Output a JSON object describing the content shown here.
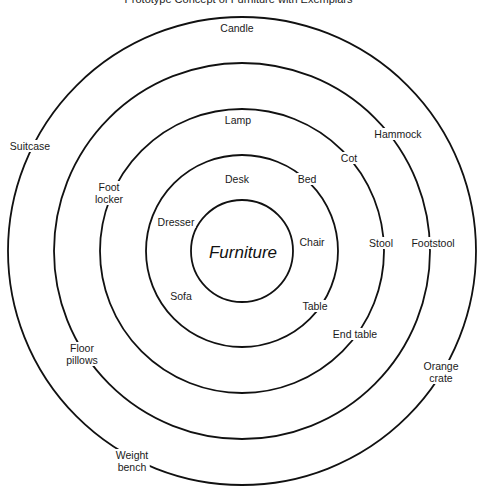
{
  "title": "Prototype Concept of Furniture with Exemplars",
  "diagram": {
    "center": {
      "x": 242,
      "y": 251
    },
    "rings": [
      {
        "name": "core",
        "radius": 51
      },
      {
        "name": "ring-1",
        "radius": 96
      },
      {
        "name": "ring-2",
        "radius": 142
      },
      {
        "name": "ring-3",
        "radius": 188
      },
      {
        "name": "ring-4",
        "radius": 234
      }
    ],
    "stroke_color": "#111111",
    "center_label": {
      "text": "Furniture",
      "x": 243,
      "y": 253
    },
    "exemplars": [
      {
        "id": "desk",
        "lines": [
          "Desk"
        ],
        "x": 237,
        "y": 179,
        "ring": 1
      },
      {
        "id": "bed",
        "lines": [
          "Bed"
        ],
        "x": 307,
        "y": 179,
        "ring": 1
      },
      {
        "id": "dresser",
        "lines": [
          "Dresser"
        ],
        "x": 176,
        "y": 222,
        "ring": 1
      },
      {
        "id": "chair",
        "lines": [
          "Chair"
        ],
        "x": 312,
        "y": 242,
        "ring": 1
      },
      {
        "id": "sofa",
        "lines": [
          "Sofa"
        ],
        "x": 181,
        "y": 296,
        "ring": 1
      },
      {
        "id": "table",
        "lines": [
          "Table"
        ],
        "x": 315,
        "y": 306,
        "ring": 1
      },
      {
        "id": "lamp",
        "lines": [
          "Lamp"
        ],
        "x": 238,
        "y": 120,
        "ring": 2
      },
      {
        "id": "cot",
        "lines": [
          "Cot"
        ],
        "x": 349,
        "y": 158,
        "ring": 2
      },
      {
        "id": "foot-locker",
        "lines": [
          "Foot",
          "locker"
        ],
        "x": 109,
        "y": 193,
        "ring": 2
      },
      {
        "id": "stool",
        "lines": [
          "Stool"
        ],
        "x": 381,
        "y": 243,
        "ring": 2
      },
      {
        "id": "end-table",
        "lines": [
          "End table"
        ],
        "x": 355,
        "y": 334,
        "ring": 2
      },
      {
        "id": "floor-pillows",
        "lines": [
          "Floor",
          "pillows"
        ],
        "x": 82,
        "y": 354,
        "ring": 3
      },
      {
        "id": "hammock",
        "lines": [
          "Hammock"
        ],
        "x": 398,
        "y": 134,
        "ring": 3
      },
      {
        "id": "footstool",
        "lines": [
          "Footstool"
        ],
        "x": 433,
        "y": 243,
        "ring": 3
      },
      {
        "id": "candle",
        "lines": [
          "Candle"
        ],
        "x": 237,
        "y": 28,
        "ring": 4
      },
      {
        "id": "suitcase",
        "lines": [
          "Suitcase"
        ],
        "x": 30,
        "y": 146,
        "ring": 4
      },
      {
        "id": "orange-crate",
        "lines": [
          "Orange",
          "crate"
        ],
        "x": 441,
        "y": 372,
        "ring": 4
      },
      {
        "id": "weight-bench",
        "lines": [
          "Weight",
          "bench"
        ],
        "x": 132,
        "y": 461,
        "ring": 4
      }
    ]
  }
}
